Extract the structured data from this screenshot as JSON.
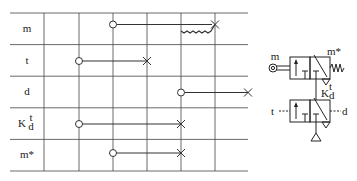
{
  "rows": [
    {
      "id": "m",
      "label": "m"
    },
    {
      "id": "t",
      "label": "t"
    },
    {
      "id": "d",
      "label": "d"
    },
    {
      "id": "kd",
      "label": "K",
      "sup": "t",
      "sub": "d"
    },
    {
      "id": "mstar",
      "label": "m*"
    }
  ],
  "columns": 6,
  "signals": [
    {
      "row": "m",
      "start_col": 3,
      "end_col": 5,
      "start": "circle",
      "end": "cross",
      "note": "spring return from col 4 to col 5"
    },
    {
      "row": "t",
      "start_col": 2,
      "end_col": 4,
      "start": "circle",
      "end": "cross"
    },
    {
      "row": "d",
      "start_col": 5,
      "end_col": 7,
      "start": "circle",
      "end": "cross"
    },
    {
      "row": "kd",
      "start_col": 2,
      "end_col": 5,
      "start": "circle",
      "end": "cross"
    },
    {
      "row": "mstar",
      "start_col": 3,
      "end_col": 5,
      "start": "circle",
      "end": "cross"
    }
  ],
  "valve_symbol": {
    "labels": {
      "m": "m",
      "mstar": "m*",
      "kd_base": "K",
      "kd_sup": "t",
      "kd_sub": "d",
      "t": "t",
      "d": "d"
    }
  }
}
